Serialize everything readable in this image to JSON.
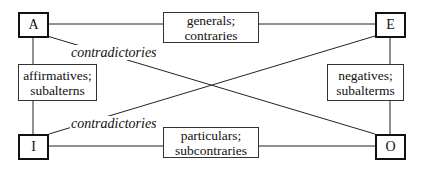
{
  "diagram": {
    "corners": {
      "A": "A",
      "E": "E",
      "I": "I",
      "O": "O"
    },
    "relations": {
      "top": {
        "line1": "generals;",
        "line2": "contraries"
      },
      "bottom": {
        "line1": "particulars;",
        "line2": "subcontraries"
      },
      "left": {
        "line1": "affirmatives;",
        "line2": "subalterns"
      },
      "right": {
        "line1": "negatives;",
        "line2": "subalterms"
      },
      "diagonal_top": "contradictories",
      "diagonal_bottom": "contradictories"
    },
    "colors": {
      "stroke": "#111111",
      "background": "#ffffff"
    }
  }
}
